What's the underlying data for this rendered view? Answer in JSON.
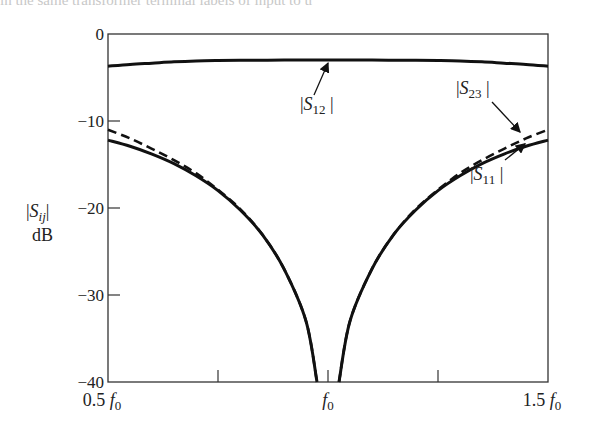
{
  "header_fragment": "in the same transformer terminal labels of input to u",
  "chart_data": {
    "type": "line",
    "title": "",
    "xlabel": "",
    "ylabel": "|S_ij| dB",
    "ylabel_line1": "|S",
    "ylabel_sub": "ij",
    "ylabel_line2": "dB",
    "xlim": [
      0.5,
      1.5
    ],
    "ylim": [
      -40,
      0
    ],
    "grid": false,
    "legend": "none (curves labeled by arrows)",
    "y_ticks": [
      0,
      -10,
      -20,
      -30,
      -40
    ],
    "y_tick_labels": [
      "0",
      "−10",
      "−20",
      "−30",
      "−40"
    ],
    "x_ticks": [
      0.5,
      0.75,
      1.0,
      1.25,
      1.5
    ],
    "x_tick_labels": [
      {
        "pos": 0.5,
        "num": "0.5",
        "sym": "f",
        "sub": "0"
      },
      {
        "pos": 1.0,
        "num": "",
        "sym": "f",
        "sub": "0"
      },
      {
        "pos": 1.5,
        "num": "1.5",
        "sym": "f",
        "sub": "0"
      }
    ],
    "x": [
      0.5,
      0.55,
      0.6,
      0.65,
      0.7,
      0.75,
      0.8,
      0.85,
      0.9,
      0.95,
      0.975,
      1.0,
      1.025,
      1.05,
      1.1,
      1.15,
      1.2,
      1.25,
      1.3,
      1.35,
      1.4,
      1.45,
      1.5
    ],
    "series": [
      {
        "name": "|S12|",
        "style": "solid",
        "values": [
          -3.7,
          -3.5,
          -3.35,
          -3.2,
          -3.1,
          -3.05,
          -3.02,
          -3.01,
          -3.0,
          -3.0,
          -3.0,
          -3.0,
          -3.0,
          -3.0,
          -3.0,
          -3.01,
          -3.02,
          -3.05,
          -3.1,
          -3.2,
          -3.35,
          -3.5,
          -3.7
        ]
      },
      {
        "name": "|S11|",
        "style": "solid",
        "values": [
          -12.2,
          -12.9,
          -13.8,
          -14.9,
          -16.3,
          -18.0,
          -20.2,
          -23.0,
          -27.0,
          -33.0,
          -40.0,
          null,
          -40.0,
          -33.0,
          -27.0,
          -23.0,
          -20.2,
          -18.0,
          -16.3,
          -14.9,
          -13.8,
          -12.9,
          -12.2
        ]
      },
      {
        "name": "|S23|",
        "style": "dashed",
        "values": [
          -11.0,
          -12.0,
          -13.2,
          -14.5,
          -16.0,
          -17.9,
          -20.1,
          -23.0,
          -27.0,
          -33.0,
          -40.0,
          null,
          -40.0,
          -33.0,
          -27.0,
          -23.0,
          -20.1,
          -17.9,
          -16.0,
          -14.5,
          -13.2,
          -12.0,
          -11.0
        ]
      }
    ],
    "annotations": [
      {
        "label": "|S12|",
        "sym": "S",
        "sub": "12",
        "arrow_to_x": 1.0,
        "arrow_to_y": -3.0
      },
      {
        "label": "|S23|",
        "sym": "S",
        "sub": "23",
        "arrow_to_x": 1.45,
        "arrow_to_y": -11.8
      },
      {
        "label": "|S11|",
        "sym": "S",
        "sub": "11",
        "arrow_to_x": 1.44,
        "arrow_to_y": -12.7
      }
    ]
  }
}
